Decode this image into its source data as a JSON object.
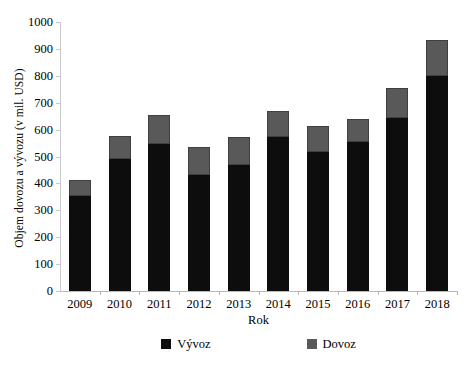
{
  "chart_data": {
    "type": "bar",
    "title": "",
    "subtitle": "",
    "xlabel": "Rok",
    "ylabel": "Objem dovozu a vývozu (v mil. USD)",
    "categories": [
      "2009",
      "2010",
      "2011",
      "2012",
      "2013",
      "2014",
      "2015",
      "2016",
      "2017",
      "2018"
    ],
    "series": [
      {
        "name": "Vývoz",
        "color": "#0D0D0D",
        "values": [
          352,
          492,
          545,
          432,
          468,
          573,
          518,
          555,
          645,
          800
        ]
      },
      {
        "name": "Dovoz",
        "color": "#595959",
        "values": [
          62,
          83,
          110,
          103,
          104,
          95,
          97,
          85,
          110,
          135
        ]
      }
    ],
    "totals": [
      414,
      575,
      655,
      535,
      572,
      668,
      615,
      640,
      755,
      935
    ],
    "stacked": true,
    "ylim": [
      0,
      1000
    ],
    "yticks": [
      0,
      100,
      200,
      300,
      400,
      500,
      600,
      700,
      800,
      900,
      1000
    ],
    "ytick_labels": [
      "0",
      "100",
      "200",
      "300",
      "400",
      "500",
      "600",
      "700",
      "800",
      "900",
      "1000"
    ],
    "grid": false,
    "legend_position": "bottom",
    "legend": [
      "Vývoz",
      "Dovoz"
    ]
  },
  "legend": {
    "entries": [
      {
        "label": "Vývoz",
        "swatch": "legend-swatch-export"
      },
      {
        "label": "Dovoz",
        "swatch": "legend-swatch-import"
      }
    ]
  }
}
